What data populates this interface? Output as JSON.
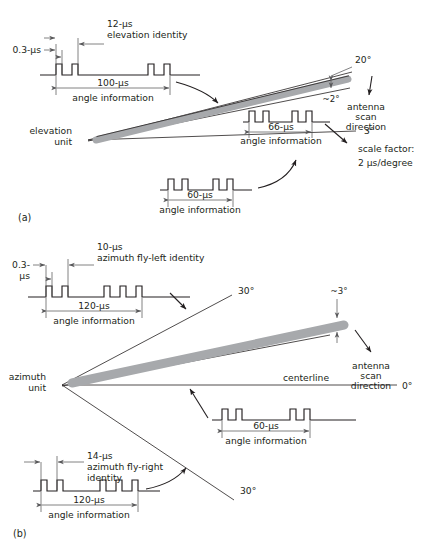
{
  "figure": {
    "title": "",
    "colors": {
      "ink": "#231f20",
      "beam_gray": "#a7a9ac",
      "dimension_gray": "#58585a",
      "background": "#ffffff"
    },
    "panels": [
      {
        "key": "a",
        "label": "(a)",
        "unit_label_line1": "elevation",
        "unit_label_line2": "unit"
      },
      {
        "key": "b",
        "label": "(b)",
        "unit_label_line1": "azimuth",
        "unit_label_line2": "unit"
      }
    ]
  },
  "panel_a": {
    "caption": "(a)",
    "unit": {
      "line1": "elevation",
      "line2": "unit"
    },
    "waveform_top": {
      "identity_value": "12-μs",
      "identity_name": "elevation identity",
      "pulse_width": "0.3-μs",
      "span_value": "100-μs",
      "span_name": "angle information"
    },
    "waveform_mid": {
      "span_value": "66-μs",
      "span_name": "angle information"
    },
    "waveform_bottom": {
      "span_value": "60-μs",
      "span_name": "angle information"
    },
    "angles": {
      "upper": "20°",
      "beamwidth": "~2°",
      "lower": "3°"
    },
    "scan_label": {
      "line1": "antenna",
      "line2": "scan",
      "line3": "direction"
    },
    "scale_factor": {
      "line1": "scale factor:",
      "line2": "2 μs/degree"
    }
  },
  "panel_b": {
    "caption": "(b)",
    "unit": {
      "line1": "azimuth",
      "line2": "unit"
    },
    "waveform_top": {
      "identity_value": "10-μs",
      "identity_name": "azimuth fly-left identity",
      "pulse_width_line1": "0.3-",
      "pulse_width_line2": "μs",
      "span_value": "120-μs",
      "span_name": "angle information"
    },
    "waveform_mid": {
      "span_value": "60-μs",
      "span_name": "angle information"
    },
    "waveform_bottom": {
      "identity_value": "14-μs",
      "identity_name_line1": "azimuth fly-right",
      "identity_name_line2": "identity",
      "span_value": "120-μs",
      "span_name": "angle information"
    },
    "angles": {
      "upper": "30°",
      "beamwidth": "~3°",
      "center": "0°",
      "lower": "30°"
    },
    "centerline_label": "centerline",
    "scan_label": {
      "line1": "antenna",
      "line2": "scan",
      "line3": "direction"
    }
  }
}
